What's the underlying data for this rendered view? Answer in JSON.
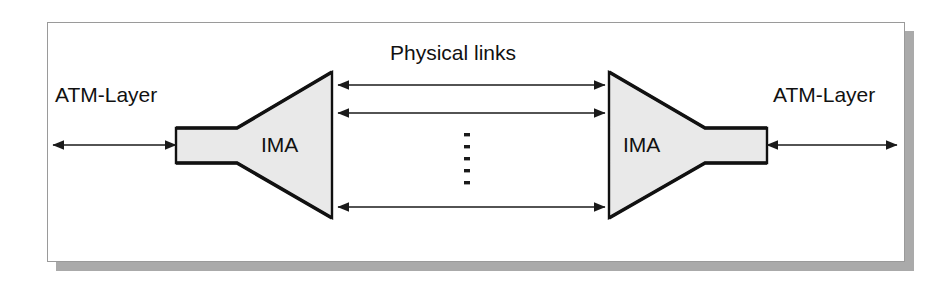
{
  "figure": {
    "title_caption": "",
    "background_color": "#ffffff",
    "frame": {
      "border_color": "#9a9a9a",
      "shadow_color": "#aaaaaa"
    }
  },
  "labels": {
    "atm_layer_left": "ATM-Layer",
    "atm_layer_right": "ATM-Layer",
    "ima_left": "IMA",
    "ima_right": "IMA",
    "physical_links": "Physical links"
  },
  "shapes": {
    "funnel_fill": "#e9e9e9",
    "funnel_stroke": "#111111",
    "arrow_color": "#1a1a1a",
    "dot_color": "#1a1a1a",
    "funnel_left": {
      "name": "IMA",
      "orientation": "flare-right",
      "neck_left": 176,
      "neck_right": 237,
      "neck_top": 128,
      "neck_bottom": 163,
      "flare_right": 332,
      "flare_top": 72,
      "flare_bottom": 218
    },
    "funnel_right": {
      "name": "IMA",
      "orientation": "flare-left",
      "neck_left": 705,
      "neck_right": 767,
      "neck_top": 128,
      "neck_bottom": 163,
      "flare_left": 609,
      "flare_top": 72,
      "flare_bottom": 218
    }
  },
  "connectors": {
    "physical_links_count_shown": 3,
    "physical_links_continuation_dots": 5,
    "physical_links": [
      {
        "label": "physical-link-1",
        "x1": 338,
        "x2": 605,
        "y": 85,
        "double_headed": true
      },
      {
        "label": "physical-link-2",
        "x1": 338,
        "x2": 605,
        "y": 113,
        "double_headed": true
      },
      {
        "label": "physical-link-n",
        "x1": 338,
        "x2": 605,
        "y": 207,
        "double_headed": true
      }
    ],
    "atm_interface_left": {
      "label": "atm-layer-interface-left",
      "x1": 53,
      "x2": 176,
      "y": 145,
      "double_headed": true
    },
    "atm_interface_right": {
      "label": "atm-layer-interface-right",
      "x1": 767,
      "x2": 897,
      "y": 145,
      "double_headed": true
    },
    "ellipsis_dots": {
      "x": 467,
      "y_start": 134,
      "y_end": 182,
      "count": 5
    }
  }
}
